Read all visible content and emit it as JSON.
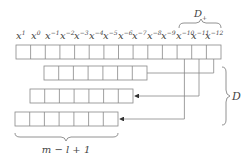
{
  "diagram": {
    "top_row": {
      "labels": [
        {
          "base": "x",
          "exp": "1"
        },
        {
          "base": "x",
          "exp": "0"
        },
        {
          "base": "x",
          "exp": "−1"
        },
        {
          "base": "x",
          "exp": "−2"
        },
        {
          "base": "x",
          "exp": "−3"
        },
        {
          "base": "x",
          "exp": "−4"
        },
        {
          "base": "x",
          "exp": "−5"
        },
        {
          "base": "x",
          "exp": "−6"
        },
        {
          "base": "x",
          "exp": "−7"
        },
        {
          "base": "x",
          "exp": "−8"
        },
        {
          "base": "x",
          "exp": "−9"
        },
        {
          "base": "x",
          "exp": "−10"
        },
        {
          "base": "x",
          "exp": "−11"
        },
        {
          "base": "x",
          "exp": "−12"
        }
      ],
      "cell_count": 14
    },
    "top_brace_label": {
      "base": "D",
      "sub": "+"
    },
    "right_brace_label": "D",
    "bottom_brace_label": "m − l + 1",
    "shifted_rows": [
      {
        "cell_count": 7,
        "source": "x^-12"
      },
      {
        "cell_count": 7,
        "source": "x^-11"
      },
      {
        "cell_count": 7,
        "source": "x^-10"
      }
    ],
    "colors": {
      "line": "#888888",
      "text": "#444444"
    }
  }
}
